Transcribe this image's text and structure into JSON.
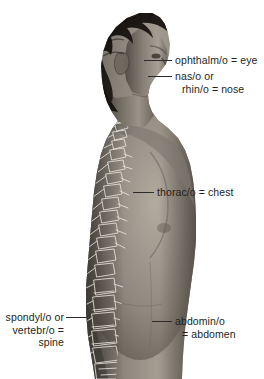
{
  "figure": {
    "background_color": "#ffffff",
    "text_color": "#231f20",
    "leader_line_color": "#2b2b2b",
    "subject": {
      "description": "grayscale photograph of a man in right-facing profile, bare torso, with a radiographic overlay of the vertebral column",
      "hair_color": "#1a1714",
      "skin_tone_midtone": "#8d8780",
      "spine_overlay_color": "#e8e4da"
    }
  },
  "labels": [
    {
      "id": "eye",
      "name": "ophthalmo-eye-label",
      "lines": [
        "ophthalm/o = eye"
      ],
      "points_to": "eye",
      "side": "right"
    },
    {
      "id": "nose",
      "name": "naso-rhino-nose-label",
      "lines": [
        "nas/o or",
        "rhin/o = nose"
      ],
      "points_to": "nose",
      "side": "right"
    },
    {
      "id": "thorax",
      "name": "thoraco-chest-label",
      "lines": [
        "thorac/o = chest"
      ],
      "points_to": "chest",
      "side": "right"
    },
    {
      "id": "abdomen",
      "name": "abdomino-abdomen-label",
      "lines": [
        "abdomin/o",
        "= abdomen"
      ],
      "points_to": "abdomen",
      "side": "right"
    },
    {
      "id": "spine",
      "name": "spondylo-vertebro-spine-label",
      "lines": [
        "spondyl/o or",
        "vertebr/o =",
        "spine"
      ],
      "points_to": "spine",
      "side": "left"
    }
  ]
}
